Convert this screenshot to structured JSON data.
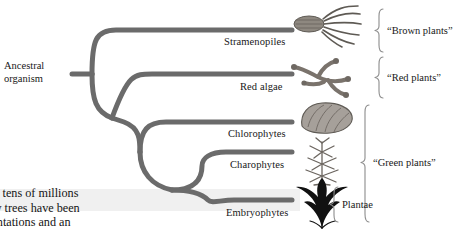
{
  "figure": {
    "ancestor": {
      "line1": "Ancestral",
      "line2": "organism"
    },
    "taxa": [
      {
        "label": "Stramenopiles",
        "organism_icon": "brown-algae-illustration"
      },
      {
        "label": "Red algae",
        "organism_icon": "red-algae-illustration"
      },
      {
        "label": "Chlorophytes",
        "organism_icon": "green-algae-illustration"
      },
      {
        "label": "Charophytes",
        "organism_icon": "charophyte-illustration"
      },
      {
        "label": "Embryophytes",
        "organism_icon": "land-plant-illustration"
      }
    ],
    "groups": [
      {
        "label": "“Brown plants”"
      },
      {
        "label": "“Red plants”"
      },
      {
        "label": "“Green plants”"
      },
      {
        "label": "Plantae"
      }
    ],
    "colors": {
      "branch": "#6b6b6b",
      "brace": "#8c8c8c",
      "band": "#f0f0f0",
      "text": "#181818"
    }
  },
  "body_text": {
    "line1": "he tens of millions",
    "line2": "rly trees have been",
    "line3": "lantations and an"
  }
}
